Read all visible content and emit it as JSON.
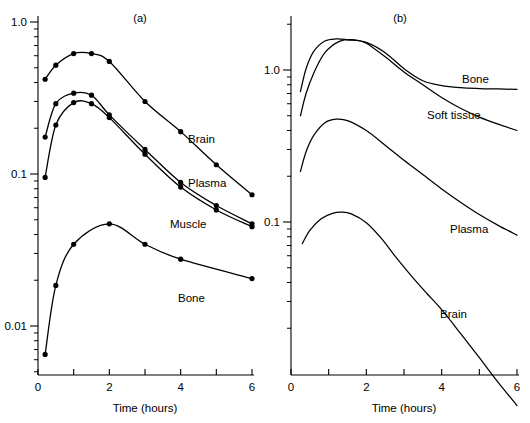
{
  "figure": {
    "background": "#ffffff",
    "ink": "#000000"
  },
  "chart_data": [
    {
      "type": "line",
      "panel": "a",
      "title": "(a)",
      "xlabel": "Time (hours)",
      "ylabel": "",
      "xlim": [
        0,
        6
      ],
      "ylim": [
        0.004,
        1.3
      ],
      "yscale": "log",
      "xscale": "linear",
      "grid": false,
      "legend": "inline-annotations",
      "xticks": [
        0,
        1,
        2,
        3,
        4,
        5,
        6
      ],
      "xticklabels": [
        "0",
        "",
        "2",
        "",
        "4",
        "",
        "6"
      ],
      "yticks": [
        0.01,
        0.1,
        1.0
      ],
      "yticklabels": [
        "0.01",
        "0.1",
        "1.0"
      ],
      "markers": "filled-circle",
      "series": [
        {
          "name": "Brain",
          "label": "Brain",
          "x": [
            0.2,
            0.5,
            1.0,
            1.5,
            2.0,
            3.0,
            4.0,
            5.0,
            6.0
          ],
          "y": [
            0.42,
            0.52,
            0.62,
            0.62,
            0.55,
            0.3,
            0.19,
            0.115,
            0.073
          ]
        },
        {
          "name": "Plasma",
          "label": "Plasma",
          "x": [
            0.2,
            0.5,
            1.0,
            1.5,
            2.0,
            3.0,
            4.0,
            5.0,
            6.0
          ],
          "y": [
            0.175,
            0.29,
            0.34,
            0.33,
            0.245,
            0.145,
            0.088,
            0.062,
            0.047
          ]
        },
        {
          "name": "Muscle",
          "label": "Muscle",
          "x": [
            0.2,
            0.5,
            1.0,
            1.5,
            2.0,
            3.0,
            4.0,
            5.0,
            6.0
          ],
          "y": [
            0.095,
            0.21,
            0.295,
            0.29,
            0.235,
            0.135,
            0.082,
            0.058,
            0.045
          ]
        },
        {
          "name": "Bone",
          "label": "Bone",
          "x": [
            0.2,
            0.5,
            1.0,
            2.0,
            3.0,
            4.0,
            6.0
          ],
          "y": [
            0.0065,
            0.0185,
            0.0345,
            0.047,
            0.0345,
            0.0275,
            0.0205
          ]
        }
      ]
    },
    {
      "type": "line",
      "panel": "b",
      "title": "(b)",
      "xlabel": "Time (hours)",
      "ylabel": "",
      "xlim": [
        0,
        6
      ],
      "ylim": [
        0.004,
        2.6
      ],
      "yscale": "log",
      "xscale": "linear",
      "grid": false,
      "legend": "inline-annotations",
      "xticks": [
        0,
        1,
        2,
        3,
        4,
        5,
        6
      ],
      "xticklabels": [
        "0",
        "",
        "2",
        "",
        "4",
        "",
        "6"
      ],
      "yticks": [
        0.1,
        1.0
      ],
      "yticklabels": [
        "0.1",
        "1.0"
      ],
      "markers": "none",
      "series": [
        {
          "name": "Bone",
          "label": "Bone",
          "x": [
            0.25,
            0.4,
            0.6,
            0.9,
            1.2,
            1.5,
            2.0,
            2.5,
            3.0,
            3.5,
            4.0,
            4.5,
            5.0,
            5.5,
            6.0
          ],
          "y": [
            0.72,
            1.02,
            1.32,
            1.55,
            1.6,
            1.58,
            1.52,
            1.3,
            1.02,
            0.85,
            0.79,
            0.765,
            0.755,
            0.75,
            0.745
          ]
        },
        {
          "name": "Soft tissue",
          "label": "Soft tissue",
          "x": [
            0.25,
            0.4,
            0.6,
            0.9,
            1.3,
            1.7,
            2.0,
            2.5,
            3.0,
            3.5,
            4.0,
            4.5,
            5.0,
            5.5,
            6.0
          ],
          "y": [
            0.5,
            0.7,
            0.95,
            1.3,
            1.55,
            1.58,
            1.5,
            1.22,
            0.97,
            0.8,
            0.66,
            0.56,
            0.49,
            0.44,
            0.4
          ]
        },
        {
          "name": "Plasma",
          "label": "Plasma",
          "x": [
            0.25,
            0.4,
            0.6,
            0.9,
            1.2,
            1.5,
            2.0,
            2.5,
            3.0,
            3.5,
            4.0,
            4.5,
            5.0,
            5.5,
            6.0
          ],
          "y": [
            0.215,
            0.29,
            0.37,
            0.45,
            0.475,
            0.465,
            0.4,
            0.32,
            0.255,
            0.205,
            0.165,
            0.135,
            0.112,
            0.095,
            0.082
          ]
        },
        {
          "name": "Brain",
          "label": "Brain",
          "x": [
            0.3,
            0.5,
            0.8,
            1.1,
            1.35,
            1.6,
            2.0,
            2.4,
            2.8,
            3.2,
            3.6,
            4.0,
            4.5,
            5.0,
            5.5,
            6.0
          ],
          "y": [
            0.072,
            0.088,
            0.105,
            0.114,
            0.116,
            0.113,
            0.099,
            0.078,
            0.058,
            0.044,
            0.034,
            0.0265,
            0.0185,
            0.0128,
            0.0088,
            0.0062
          ]
        }
      ]
    }
  ]
}
